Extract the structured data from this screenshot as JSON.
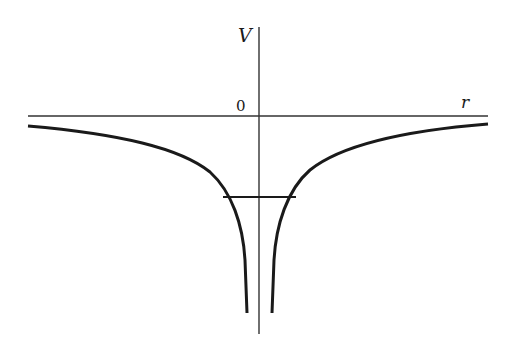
{
  "diagram": {
    "title": "",
    "type": "potential-energy-curve",
    "axes": {
      "vertical_label": "V",
      "horizontal_label": "r",
      "origin_label": "0"
    },
    "elements": [
      {
        "name": "potential-curve-left",
        "description": "attractive potential branch, approaches 0 at large |r|, diverges to -infinity near r=0"
      },
      {
        "name": "potential-curve-right",
        "description": "mirror branch on positive r side"
      },
      {
        "name": "energy-level-line",
        "description": "horizontal line marking a bound energy level"
      }
    ],
    "colors": {
      "ink": "#1a1a1a",
      "background": "#ffffff"
    }
  }
}
